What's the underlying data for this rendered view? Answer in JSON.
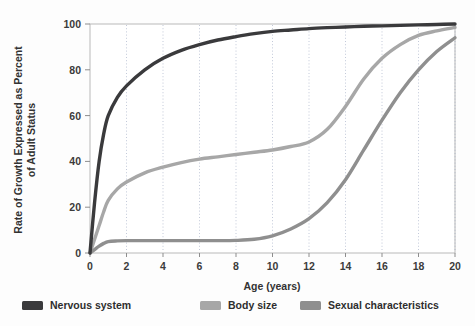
{
  "chart_data": {
    "type": "line",
    "title": "",
    "subtitle": "",
    "xlabel": "Age (years)",
    "ylabel": "Rate of Growth Expressed as Percent of Adult Status",
    "ylabel_line1": "Rate of Growth Expressed as Percent",
    "ylabel_line2": "of Adult Status",
    "xlim": [
      0,
      20
    ],
    "ylim": [
      0,
      100
    ],
    "xticks": [
      "0",
      "2",
      "4",
      "6",
      "8",
      "10",
      "12",
      "14",
      "16",
      "18",
      "20"
    ],
    "xtick_values": [
      0,
      2,
      4,
      6,
      8,
      10,
      12,
      14,
      16,
      18,
      20
    ],
    "yticks": [
      "0",
      "20",
      "40",
      "60",
      "80",
      "100"
    ],
    "ytick_values": [
      0,
      20,
      40,
      60,
      80,
      100
    ],
    "grid": "vertical-dotted",
    "legend_position": "bottom-outside",
    "x": [
      0,
      0.25,
      0.5,
      0.75,
      1,
      1.5,
      2,
      3,
      4,
      5,
      6,
      7,
      8,
      9,
      10,
      11,
      12,
      13,
      14,
      15,
      16,
      17,
      18,
      19,
      20
    ],
    "series": [
      {
        "name": "Nervous system",
        "color": "#3a3a3c",
        "values": [
          0,
          22,
          40,
          52,
          60,
          68,
          73,
          80,
          85,
          88.5,
          91,
          93,
          94.5,
          95.8,
          96.8,
          97.4,
          98,
          98.4,
          98.7,
          99,
          99.2,
          99.4,
          99.6,
          99.8,
          100
        ]
      },
      {
        "name": "Body size",
        "color": "#a7a7a7",
        "values": [
          0,
          6,
          12,
          18,
          23,
          28,
          31,
          35,
          37.5,
          39.5,
          41,
          42,
          43,
          44,
          45,
          46.5,
          48.5,
          54,
          64,
          76,
          85,
          91,
          95,
          97,
          98.5
        ]
      },
      {
        "name": "Sexual characteristics",
        "color": "#8f8f8f",
        "values": [
          0,
          1.5,
          3,
          4.2,
          5,
          5.3,
          5.4,
          5.4,
          5.4,
          5.4,
          5.4,
          5.4,
          5.5,
          6,
          7.5,
          10.5,
          15,
          22,
          32,
          45,
          58,
          70,
          80,
          88,
          94
        ]
      }
    ]
  },
  "legend": {
    "items": [
      {
        "label": "Nervous system",
        "color": "#3a3a3c"
      },
      {
        "label": "Body size",
        "color": "#a7a7a7"
      },
      {
        "label": "Sexual characteristics",
        "color": "#8f8f8f"
      }
    ]
  },
  "axes": {
    "x_title": "Age (years)",
    "y_title_line1": "Rate of Growth Expressed as Percent",
    "y_title_line2": "of Adult Status"
  },
  "colors": {
    "background": "#fdfdfd",
    "plot_border": "#b8b8b8",
    "gridline": "#9aa6c0",
    "tick_label": "#3b3b3b"
  }
}
